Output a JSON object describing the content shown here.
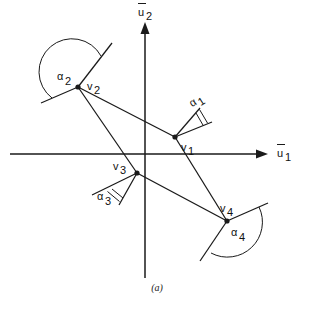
{
  "figure": {
    "caption": "(a)",
    "axes": {
      "x_label_u": "u",
      "x_label_sub": "1",
      "y_label_u": "u",
      "y_label_sub": "2",
      "x_axis_name": "u-bar-1",
      "y_axis_name": "u-bar-2",
      "origin": {
        "x": 145,
        "y": 154
      },
      "x_range_px": [
        10,
        268
      ],
      "y_range_px": [
        22,
        278
      ],
      "overbar": true
    },
    "vertices": [
      {
        "id": "v1",
        "letter": "v",
        "sub": "1",
        "x": 175,
        "y": 137,
        "label_dx": 6,
        "label_dy": 14
      },
      {
        "id": "v2",
        "letter": "v",
        "sub": "2",
        "x": 78,
        "y": 87,
        "label_dx": 9,
        "label_dy": 2
      },
      {
        "id": "v3",
        "letter": "v",
        "sub": "3",
        "x": 137,
        "y": 173,
        "label_dx": -24,
        "label_dy": -3
      },
      {
        "id": "v4",
        "letter": "v",
        "sub": "4",
        "x": 227,
        "y": 221,
        "label_dx": -7,
        "label_dy": -9
      }
    ],
    "edges": [
      {
        "from": "v1",
        "to": "v2"
      },
      {
        "from": "v2",
        "to": "v3"
      },
      {
        "from": "v3",
        "to": "v4"
      },
      {
        "from": "v4",
        "to": "v1"
      }
    ],
    "extensions": [
      {
        "at": "v1",
        "to_x": 200,
        "to_y": 113,
        "name": "extension-v1-a"
      },
      {
        "at": "v1",
        "to_x": 206,
        "to_y": 124,
        "name": "extension-v1-b"
      },
      {
        "at": "v2",
        "to_x": 110,
        "to_y": 46,
        "name": "extension-v2-a"
      },
      {
        "at": "v2",
        "to_x": 43,
        "to_y": 101,
        "name": "extension-v2-b"
      },
      {
        "at": "v3",
        "to_x": 113,
        "to_y": 188,
        "name": "extension-v3-a"
      },
      {
        "at": "v3",
        "to_x": 124,
        "to_y": 199,
        "name": "extension-v3-b"
      },
      {
        "at": "v4",
        "to_x": 266,
        "to_y": 205,
        "name": "extension-v4-a"
      },
      {
        "at": "v4",
        "to_x": 202,
        "to_y": 259,
        "name": "extension-v4-b"
      }
    ],
    "angles": [
      {
        "id": "alpha1",
        "letter": "α",
        "sub": "1",
        "label_x": 197,
        "label_y": 104,
        "type": "narrow",
        "arc_count": 2,
        "at": "v1"
      },
      {
        "id": "alpha2",
        "letter": "α",
        "sub": "2",
        "label_x": 63,
        "label_y": 81,
        "type": "wide",
        "arc_count": 1,
        "at": "v2"
      },
      {
        "id": "alpha3",
        "letter": "α",
        "sub": "3",
        "label_x": 103,
        "label_y": 202,
        "type": "narrow",
        "arc_count": 2,
        "at": "v3"
      },
      {
        "id": "alpha4",
        "letter": "α",
        "sub": "4",
        "label_x": 237,
        "label_y": 238,
        "type": "wide",
        "arc_count": 1,
        "at": "v4"
      }
    ],
    "colors": {
      "ink": "#1a1a1a",
      "background": "#ffffff"
    }
  }
}
